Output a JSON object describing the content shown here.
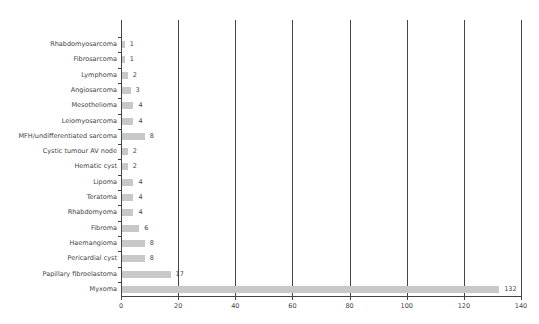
{
  "chart_data": {
    "type": "bar",
    "orientation": "horizontal",
    "title": "",
    "xlabel": "",
    "ylabel": "",
    "xlim": [
      0,
      140
    ],
    "xticks": [
      0,
      20,
      40,
      60,
      80,
      100,
      120,
      140
    ],
    "grid": "vertical",
    "categories": [
      "Rhabdomyosarcoma",
      "Fibrosarcoma",
      "Lymphoma",
      "Angiosarcoma",
      "Mesothelioma",
      "Leiomyosarcoma",
      "MFH/undifferentiated sarcoma",
      "Cystic tumour AV node",
      "Hematic cyst",
      "Lipoma",
      "Teratoma",
      "Rhabdomyoma",
      "Fibroma",
      "Haemangioma",
      "Pericardial cyst",
      "Papillary fibroelastoma",
      "Myxoma"
    ],
    "values": [
      1,
      1,
      2,
      3,
      4,
      4,
      8,
      2,
      2,
      4,
      4,
      4,
      6,
      8,
      8,
      17,
      132
    ],
    "bar_color": "#c8c8c8"
  }
}
